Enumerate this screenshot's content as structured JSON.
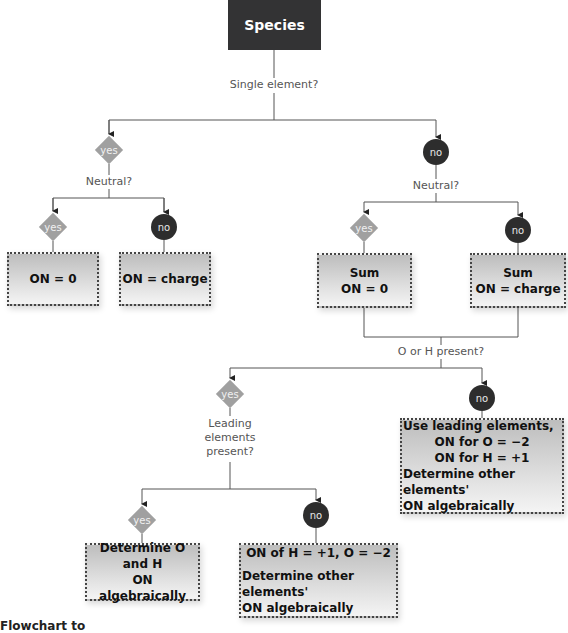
{
  "root": {
    "label": "Species"
  },
  "questions": {
    "single_element": "Single element?",
    "neutral_left": "Neutral?",
    "neutral_right": "Neutral?",
    "o_or_h": "O or H present?",
    "leading_line1": "Leading",
    "leading_line2": "elements",
    "leading_line3": "present?"
  },
  "decisions": {
    "single_yes": "yes",
    "single_no": "no",
    "left_neutral_yes": "yes",
    "left_neutral_no": "no",
    "right_neutral_yes": "yes",
    "right_neutral_no": "no",
    "oh_yes": "yes",
    "oh_no": "no",
    "leading_yes": "yes",
    "leading_no": "no"
  },
  "results": {
    "on_zero": "ON = 0",
    "on_charge": "ON = charge",
    "sum_zero_line1": "Sum",
    "sum_zero_line2": "ON = 0",
    "sum_charge_line1": "Sum",
    "sum_charge_line2": "ON = charge",
    "use_leading_line1": "Use leading elements,",
    "use_leading_line2": "ON for O = −2",
    "use_leading_line3": "ON for H = +1",
    "use_leading_line4": "Determine other elements'",
    "use_leading_line5": "ON algebraically",
    "determine_oh_line1": "Determine O and H",
    "determine_oh_line2": "ON algebraically",
    "on_of_h_line1": "ON of H = +1, O = −2",
    "on_of_h_line2": "Determine other elements'",
    "on_of_h_line3": "ON algebraically"
  },
  "caption": "Flowchart to",
  "colors": {
    "root_bg": "#333334",
    "yes_diamond": "#a0a0a0",
    "no_circle": "#2d2d2d",
    "connector": "#555555"
  }
}
